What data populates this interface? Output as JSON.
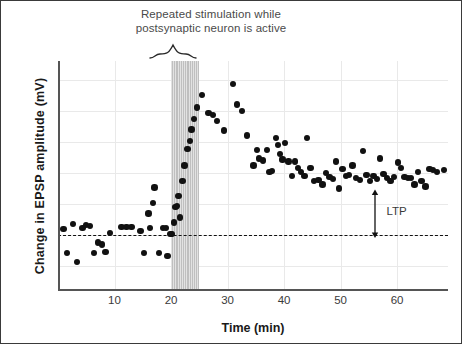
{
  "figure": {
    "title_line1": "Repeated stimulation while",
    "title_line2": "postsynaptic neuron is active",
    "annotation_label": "LTP"
  },
  "chart_data": {
    "type": "scatter",
    "title": "Repeated stimulation while postsynaptic neuron is active",
    "xlabel": "Time (min)",
    "ylabel": "Change in EPSP amplitude (mV)",
    "xlim": [
      0,
      69
    ],
    "ylim": [
      -2.6,
      8.4
    ],
    "xticks": [
      10,
      20,
      30,
      40,
      50,
      60
    ],
    "xtick_labels": [
      "10",
      "20",
      "30",
      "40",
      "50",
      "60"
    ],
    "yticks": [],
    "ytick_labels": [],
    "grid": true,
    "legend": false,
    "baseline": {
      "value": 0,
      "style": "dashed",
      "color": "#111111",
      "label": ""
    },
    "shaded_region": {
      "label": "Repeated stimulation while postsynaptic neuron is active",
      "x_start": 20,
      "x_end": 25,
      "color": "#bfbfbf",
      "hatch": "vertical-lines"
    },
    "annotations": [
      {
        "text": "LTP",
        "x": 56,
        "y_top": 2.1,
        "y_bottom": 0,
        "arrow": "double-headed",
        "color": "#111111"
      }
    ],
    "marker": {
      "shape": "circle",
      "color": "#111111",
      "size": 6
    },
    "series": [
      {
        "name": "Change in EPSP amplitude",
        "points": [
          [
            1.0,
            0.3
          ],
          [
            1.6,
            -0.85
          ],
          [
            2.6,
            0.55
          ],
          [
            3.4,
            -1.3
          ],
          [
            4.3,
            0.35
          ],
          [
            5.0,
            0.5
          ],
          [
            5.7,
            0.45
          ],
          [
            6.4,
            -0.85
          ],
          [
            7.1,
            -0.35
          ],
          [
            7.8,
            -0.45
          ],
          [
            8.4,
            -0.8
          ],
          [
            9.2,
            0.1
          ],
          [
            11.2,
            0.4
          ],
          [
            12.1,
            0.4
          ],
          [
            13.0,
            0.4
          ],
          [
            14.6,
            0.2
          ],
          [
            15.2,
            -0.85
          ],
          [
            16.0,
            1.05
          ],
          [
            16.3,
            0.35
          ],
          [
            16.8,
            1.55
          ],
          [
            17.1,
            2.3
          ],
          [
            17.9,
            -0.85
          ],
          [
            18.6,
            0.35
          ],
          [
            19.1,
            0.35
          ],
          [
            19.4,
            -1.0
          ],
          [
            19.9,
            0.05
          ],
          [
            20.2,
            0.05
          ],
          [
            20.5,
            0.6
          ],
          [
            20.8,
            1.35
          ],
          [
            21.0,
            1.4
          ],
          [
            21.3,
            1.9
          ],
          [
            21.6,
            0.85
          ],
          [
            22.0,
            2.6
          ],
          [
            22.4,
            3.35
          ],
          [
            22.9,
            4.15
          ],
          [
            23.3,
            4.55
          ],
          [
            23.6,
            5.1
          ],
          [
            24.1,
            5.6
          ],
          [
            24.6,
            6.15
          ],
          [
            25.5,
            6.75
          ],
          [
            26.6,
            5.9
          ],
          [
            27.4,
            5.8
          ],
          [
            28.1,
            5.5
          ],
          [
            29.4,
            5.05
          ],
          [
            31.0,
            7.3
          ],
          [
            31.7,
            6.3
          ],
          [
            32.6,
            6.0
          ],
          [
            33.4,
            4.8
          ],
          [
            34.6,
            3.35
          ],
          [
            35.2,
            4.1
          ],
          [
            35.6,
            3.7
          ],
          [
            36.3,
            3.6
          ],
          [
            37.0,
            4.1
          ],
          [
            37.4,
            3.05
          ],
          [
            37.9,
            3.1
          ],
          [
            38.6,
            4.7
          ],
          [
            38.9,
            4.35
          ],
          [
            39.3,
            3.9
          ],
          [
            39.7,
            3.65
          ],
          [
            40.2,
            4.45
          ],
          [
            40.8,
            3.55
          ],
          [
            41.4,
            2.85
          ],
          [
            41.9,
            3.55
          ],
          [
            42.5,
            3.25
          ],
          [
            43.0,
            3.05
          ],
          [
            43.6,
            2.85
          ],
          [
            44.1,
            4.7
          ],
          [
            44.7,
            3.25
          ],
          [
            45.3,
            2.6
          ],
          [
            46.1,
            2.65
          ],
          [
            46.8,
            2.45
          ],
          [
            47.4,
            3.0
          ],
          [
            48.0,
            2.8
          ],
          [
            48.6,
            2.7
          ],
          [
            49.2,
            3.55
          ],
          [
            49.7,
            2.25
          ],
          [
            50.3,
            3.2
          ],
          [
            50.9,
            2.85
          ],
          [
            51.5,
            2.9
          ],
          [
            52.1,
            3.35
          ],
          [
            52.7,
            2.75
          ],
          [
            53.4,
            2.65
          ],
          [
            54.0,
            4.05
          ],
          [
            54.6,
            2.9
          ],
          [
            55.2,
            2.6
          ],
          [
            55.8,
            2.85
          ],
          [
            56.4,
            2.7
          ],
          [
            57.0,
            3.7
          ],
          [
            57.6,
            2.95
          ],
          [
            58.2,
            2.75
          ],
          [
            58.8,
            2.6
          ],
          [
            59.4,
            2.8
          ],
          [
            60.1,
            3.5
          ],
          [
            60.7,
            3.25
          ],
          [
            61.3,
            2.8
          ],
          [
            61.9,
            2.75
          ],
          [
            62.5,
            2.75
          ],
          [
            63.1,
            2.45
          ],
          [
            63.7,
            3.05
          ],
          [
            64.3,
            2.6
          ],
          [
            65.0,
            2.35
          ],
          [
            65.7,
            3.2
          ],
          [
            66.3,
            3.15
          ],
          [
            67.0,
            3.05
          ],
          [
            68.3,
            3.15
          ]
        ]
      }
    ]
  }
}
